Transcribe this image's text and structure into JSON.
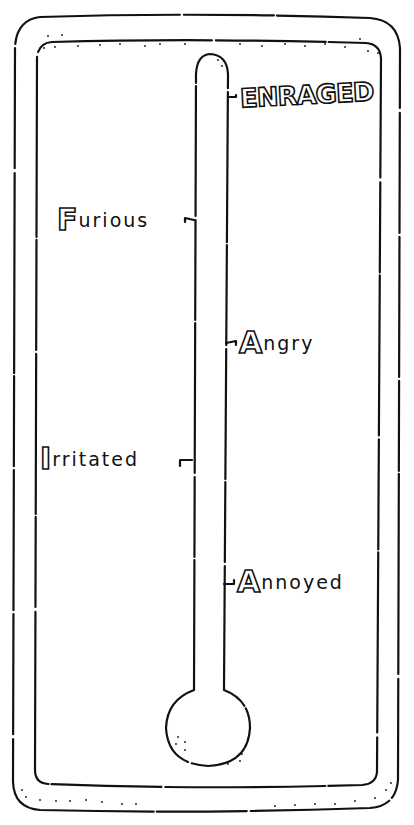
{
  "diagram": {
    "type": "anger-thermometer",
    "colors": {
      "ink": "#111111",
      "paper": "#ffffff"
    },
    "levels": [
      {
        "id": "enraged",
        "label": "ENRAGED",
        "side": "right",
        "order": 5
      },
      {
        "id": "furious",
        "label": "Furious",
        "initial": "F",
        "rest": "urious",
        "side": "left",
        "order": 4
      },
      {
        "id": "angry",
        "label": "Angry",
        "initial": "A",
        "rest": "ngry",
        "side": "right",
        "order": 3
      },
      {
        "id": "irritated",
        "label": "Irritated",
        "initial": "I",
        "rest": "rritated",
        "side": "left",
        "order": 2
      },
      {
        "id": "annoyed",
        "label": "Annoyed",
        "initial": "A",
        "rest": "nnoyed",
        "side": "right",
        "order": 1
      }
    ]
  }
}
